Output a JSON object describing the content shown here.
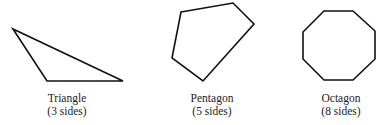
{
  "shapes": [
    {
      "name": "Triangle",
      "sides_label": "(3 sides)",
      "points": "13,29 47,81 123,81",
      "label_cx": 67
    },
    {
      "name": "Pentagon",
      "sides_label": "(5 sides)",
      "points": "181,12 233,3 254,24 203,81 172,58",
      "label_cx": 212
    },
    {
      "name": "Octagon",
      "sides_label": "(8 sides)",
      "points": "303,32 324,11 353,11 375,31 375,59 353,80 324,80 303,59",
      "label_cx": 341
    }
  ],
  "style": {
    "stroke": "#111111",
    "stroke_width": 1.6
  }
}
